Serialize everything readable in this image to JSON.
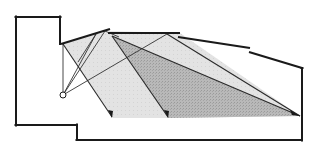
{
  "diagram": {
    "type": "acoustic-ray-section",
    "colors": {
      "background": "#ffffff",
      "light_region": "#e4e4e4",
      "dark_region": "#b8b8b8",
      "line": "#1a1a1a"
    },
    "room_outline": [
      [
        16,
        17
      ],
      [
        60,
        17
      ],
      [
        60,
        44
      ]
    ],
    "floor_outline": [
      [
        16,
        17
      ],
      [
        16,
        125
      ],
      [
        77,
        125
      ],
      [
        77,
        140
      ],
      [
        302,
        140
      ],
      [
        302,
        68
      ]
    ],
    "reflector_panels": [
      {
        "name": "panel-1",
        "from": [
          62,
          44
        ],
        "to": [
          110,
          29
        ]
      },
      {
        "name": "panel-2",
        "from": [
          108,
          33
        ],
        "to": [
          180,
          33
        ]
      },
      {
        "name": "panel-3",
        "from": [
          180,
          37
        ],
        "to": [
          250,
          48
        ]
      },
      {
        "name": "panel-4",
        "from": [
          250,
          52
        ],
        "to": [
          302,
          68
        ]
      }
    ],
    "source": {
      "x": 63,
      "y": 95,
      "r": 3
    },
    "regions": {
      "light": [
        [
          63,
          44
        ],
        [
          108,
          31
        ],
        [
          180,
          33
        ],
        [
          300,
          116
        ],
        [
          170,
          118
        ],
        [
          113,
          118
        ]
      ],
      "dark": [
        [
          112,
          36
        ],
        [
          300,
          116
        ],
        [
          168,
          118
        ]
      ]
    },
    "rays": [
      {
        "from": [
          63,
          95
        ],
        "to": [
          63,
          44
        ]
      },
      {
        "from": [
          63,
          95
        ],
        "to": [
          95,
          34
        ]
      },
      {
        "from": [
          63,
          95
        ],
        "to": [
          105,
          31
        ]
      },
      {
        "from": [
          63,
          95
        ],
        "to": [
          167,
          34
        ]
      },
      {
        "from": [
          63,
          44
        ],
        "to": [
          112,
          116
        ]
      },
      {
        "from": [
          95,
          34
        ],
        "to": [
          78,
          60
        ]
      },
      {
        "from": [
          105,
          31
        ],
        "to": [
          168,
          116
        ]
      },
      {
        "from": [
          112,
          36
        ],
        "to": [
          300,
          116
        ]
      },
      {
        "from": [
          167,
          34
        ],
        "to": [
          300,
          116
        ]
      }
    ],
    "arrowheads": [
      {
        "at": [
          112,
          117
        ],
        "angle": 56
      },
      {
        "at": [
          168,
          117
        ],
        "angle": 54
      },
      {
        "at": [
          299,
          116
        ],
        "angle": 23
      }
    ]
  }
}
